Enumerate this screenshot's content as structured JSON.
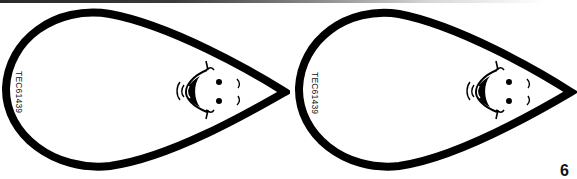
{
  "page": {
    "background": "#ffffff",
    "outline_color": "#000000"
  },
  "drops": [
    {
      "code": "TEC61439",
      "face": "smiling-face"
    },
    {
      "code": "TEC61439",
      "face": "smiling-face"
    }
  ],
  "corner": {
    "glyph": "6"
  }
}
